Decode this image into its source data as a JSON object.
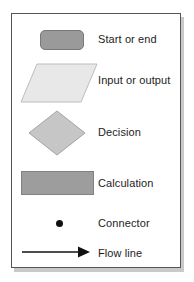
{
  "diagram": {
    "background_color": "#ffffff",
    "frame": {
      "border_color": "#555555",
      "shadow_color": "#c9c9c9",
      "fill_color": "#ffffff"
    },
    "rows": [
      {
        "key": "start_or_end",
        "label": "Start or end",
        "symbol": "rounded-rectangle",
        "fill_color": "#9a9a9a",
        "stroke_color": "#787878"
      },
      {
        "key": "input_or_output",
        "label": "Input or output",
        "symbol": "parallelogram",
        "fill_color": "#e8e8e8",
        "stroke_color": "#bdbdbd"
      },
      {
        "key": "decision",
        "label": "Decision",
        "symbol": "diamond",
        "fill_color": "#c6c6c6",
        "stroke_color": "#a3a3a3"
      },
      {
        "key": "calculation",
        "label": "Calculation",
        "symbol": "rectangle",
        "fill_color": "#9d9d9d",
        "stroke_color": "#818181"
      },
      {
        "key": "connector",
        "label": "Connector",
        "symbol": "filled-circle",
        "fill_color": "#111111",
        "stroke_color": "#111111"
      },
      {
        "key": "flow_line",
        "label": "Flow line",
        "symbol": "arrow-right",
        "fill_color": "#111111",
        "stroke_color": "#111111"
      }
    ]
  }
}
